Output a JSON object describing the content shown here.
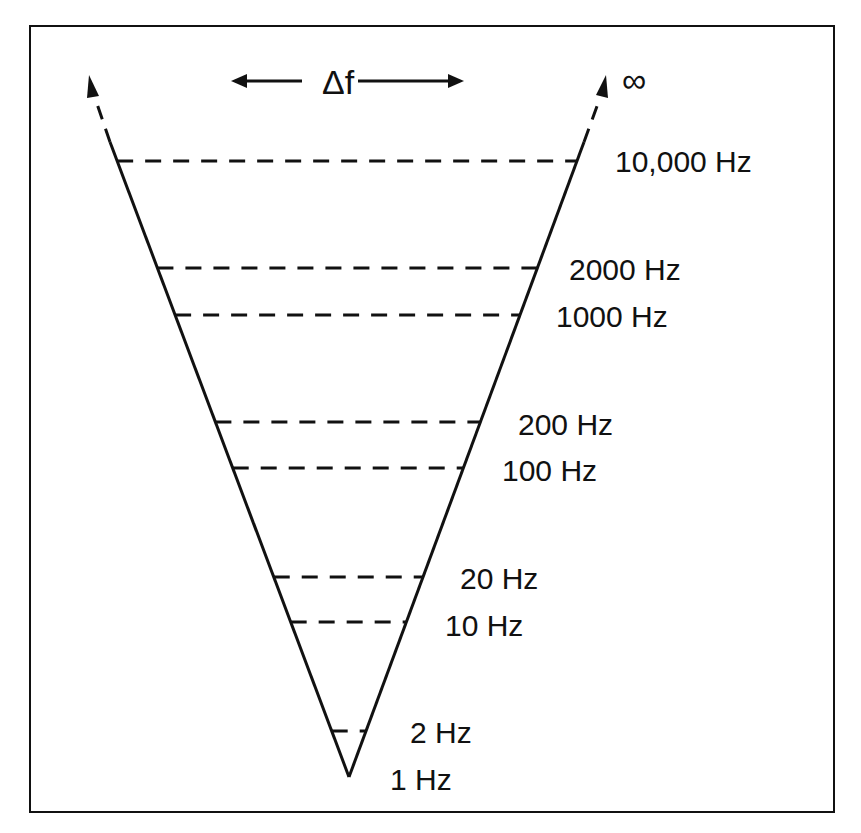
{
  "diagram": {
    "delta_label": "Δf",
    "infinity_label": "∞",
    "levels": [
      {
        "label": "10,000 Hz",
        "y": 161,
        "lx": 615,
        "ly": 172
      },
      {
        "label": "2000 Hz",
        "y": 268,
        "lx": 569,
        "ly": 280
      },
      {
        "label": "1000 Hz",
        "y": 315,
        "lx": 556,
        "ly": 327
      },
      {
        "label": "200 Hz",
        "y": 422,
        "lx": 518,
        "ly": 435
      },
      {
        "label": "100 Hz",
        "y": 468,
        "lx": 502,
        "ly": 481
      },
      {
        "label": "20 Hz",
        "y": 577,
        "lx": 460,
        "ly": 589
      },
      {
        "label": "10 Hz",
        "y": 622,
        "lx": 445,
        "ly": 636
      },
      {
        "label": "2 Hz",
        "y": 731,
        "lx": 410,
        "ly": 743
      },
      {
        "label": "1 Hz",
        "y": 777,
        "lx": 390,
        "ly": 790
      }
    ],
    "colors": {
      "line": "#111111",
      "background": "#ffffff"
    }
  }
}
